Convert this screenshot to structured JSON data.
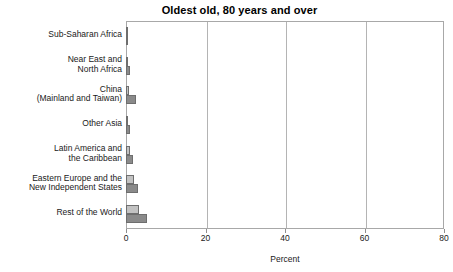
{
  "chart_data": {
    "type": "bar",
    "orientation": "horizontal",
    "title": "Oldest old, 80 years and over",
    "xlabel": "Percent",
    "ylabel": "",
    "xlim": [
      0,
      80
    ],
    "xticks": [
      0,
      20,
      40,
      60,
      80
    ],
    "xticklabels": [
      "0",
      "20",
      "40",
      "60",
      "80"
    ],
    "grid": true,
    "legend": "none",
    "categories": [
      "Sub-Saharan Africa",
      "Near East and\nNorth Africa",
      "China\n(Mainland and Taiwan)",
      "Other Asia",
      "Latin America and\nthe Caribbean",
      "Eastern Europe and the\nNew Independent States",
      "Rest of the World"
    ],
    "series": [
      {
        "name": "Series 1",
        "color": "#c2c2c2",
        "values": [
          0.3,
          0.4,
          0.8,
          0.4,
          1.0,
          2.0,
          3.3
        ]
      },
      {
        "name": "Series 2",
        "color": "#8a8a8a",
        "values": [
          0.5,
          1.0,
          2.5,
          1.0,
          1.8,
          3.0,
          5.3
        ]
      }
    ]
  },
  "colors": {
    "series_light": "#c2c2c2",
    "series_dark": "#8a8a8a",
    "bar_edge": "#6e6e6e",
    "frame": "#a8a8a8",
    "gridline": "#b4b4b4",
    "text": "#1a1a1a",
    "background": "#ffffff"
  }
}
